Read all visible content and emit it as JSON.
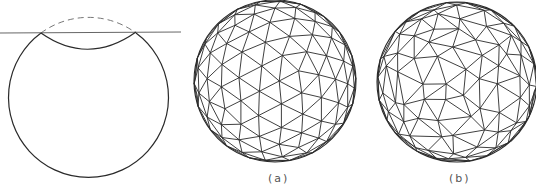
{
  "figure": {
    "panels": [
      {
        "id": "cut-sphere",
        "description": "Sphere cross-section cut by a plane; removed cap shown dashed, cut boundary shown as curve"
      },
      {
        "id": "a",
        "label": "(a)",
        "description": "Regular geodesic triangulated sphere"
      },
      {
        "id": "b",
        "label": "(b)",
        "description": "Irregular triangulated sphere"
      }
    ],
    "colors": {
      "stroke": "#2a2a2a",
      "plane": "#555555",
      "dashed": "#777777",
      "background": "#ffffff"
    }
  }
}
